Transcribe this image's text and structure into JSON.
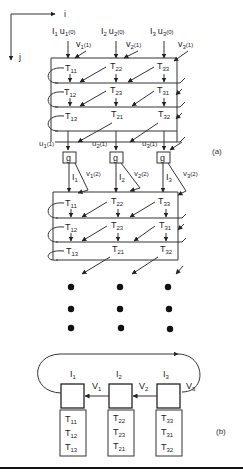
{
  "axes": {
    "horizontal": "i",
    "vertical": "j"
  },
  "panel_a": {
    "label": "(a)",
    "inputs": [
      {
        "I": "I",
        "I_sub": "1",
        "u": "u",
        "u_sub": "1",
        "u_arg": "(0)",
        "v": "v",
        "v_sub": "1",
        "v_arg": "(1)"
      },
      {
        "I": "I",
        "I_sub": "2",
        "u": "u",
        "u_sub": "2",
        "u_arg": "(0)",
        "v": "v",
        "v_sub": "2",
        "v_arg": "(1)"
      },
      {
        "I": "I",
        "I_sub": "3",
        "u": "u",
        "u_sub": "3",
        "u_arg": "(0)",
        "v": "v",
        "v_sub": "3",
        "v_arg": "(1)"
      }
    ],
    "block1_rows": [
      [
        {
          "T": "T",
          "sub": "11"
        },
        {
          "T": "T",
          "sub": "22"
        },
        {
          "T": "T",
          "sub": "33"
        }
      ],
      [
        {
          "T": "T",
          "sub": "12"
        },
        {
          "T": "T",
          "sub": "23"
        },
        {
          "T": "T",
          "sub": "31"
        }
      ],
      [
        {
          "T": "T",
          "sub": "13"
        },
        {
          "T": "T",
          "sub": "21"
        },
        {
          "T": "T",
          "sub": "32"
        }
      ]
    ],
    "outputs": [
      {
        "u": "u",
        "u_sub": "1",
        "u_arg": "(1)"
      },
      {
        "u": "u",
        "u_sub": "2",
        "u_arg": "(1)"
      },
      {
        "u": "u",
        "u_sub": "3",
        "u_arg": "(1)"
      }
    ],
    "g_boxes": [
      "g",
      "g",
      "g"
    ],
    "second_inputs": [
      {
        "I": "I",
        "I_sub": "1",
        "v": "v",
        "v_sub": "1",
        "v_arg": "(2)"
      },
      {
        "I": "I",
        "I_sub": "2",
        "v": "v",
        "v_sub": "2",
        "v_arg": "(2)"
      },
      {
        "I": "I",
        "I_sub": "3",
        "v": "v",
        "v_sub": "3",
        "v_arg": "(2)"
      }
    ],
    "block2_rows": [
      [
        {
          "T": "T",
          "sub": "11"
        },
        {
          "T": "T",
          "sub": "22"
        },
        {
          "T": "T",
          "sub": "33"
        }
      ],
      [
        {
          "T": "T",
          "sub": "12"
        },
        {
          "T": "T",
          "sub": "23"
        },
        {
          "T": "T",
          "sub": "31"
        }
      ],
      [
        {
          "T": "T",
          "sub": "13"
        },
        {
          "T": "T",
          "sub": "21"
        },
        {
          "T": "T",
          "sub": "32"
        }
      ]
    ],
    "continuation": "vertical ellipsis (3 columns × 3 dots)"
  },
  "panel_b": {
    "label": "(b)",
    "processors": [
      {
        "I": "I",
        "I_sub": "1",
        "V": "V",
        "V_sub": "1",
        "tasks": [
          {
            "T": "T",
            "sub": "11"
          },
          {
            "T": "T",
            "sub": "12"
          },
          {
            "T": "T",
            "sub": "13"
          }
        ]
      },
      {
        "I": "I",
        "I_sub": "2",
        "V": "V",
        "V_sub": "2",
        "tasks": [
          {
            "T": "T",
            "sub": "22"
          },
          {
            "T": "T",
            "sub": "23"
          },
          {
            "T": "T",
            "sub": "21"
          }
        ]
      },
      {
        "I": "I",
        "I_sub": "3",
        "V": "V",
        "V_sub": "3",
        "tasks": [
          {
            "T": "T",
            "sub": "33"
          },
          {
            "T": "T",
            "sub": "31"
          },
          {
            "T": "T",
            "sub": "32"
          }
        ]
      }
    ]
  },
  "colors": {
    "ink": "#222222",
    "background": "#ffffff"
  }
}
